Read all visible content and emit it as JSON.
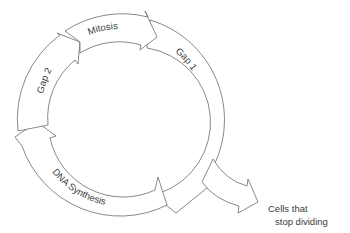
{
  "diagram": {
    "phases": [
      {
        "id": "mitosis",
        "label": "Mitosis"
      },
      {
        "id": "gap1",
        "label": "Gap 1"
      },
      {
        "id": "dna_synthesis",
        "label": "DNA Synthesis"
      },
      {
        "id": "gap2",
        "label": "Gap 2"
      }
    ],
    "exit_branch": {
      "from": "gap1",
      "label_line1": "Cells that",
      "label_line2": "stop dividing"
    },
    "colors": {
      "stroke": "#6a6a6a",
      "fill": "#ffffff",
      "text": "#3a3a3a",
      "background": "#ffffff"
    }
  }
}
